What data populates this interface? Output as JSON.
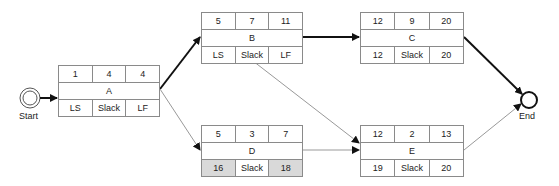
{
  "start": {
    "label": "Start"
  },
  "end": {
    "label": "End"
  },
  "nodes": {
    "A": {
      "es": "1",
      "dur": "4",
      "ef": "4",
      "name": "A",
      "ls": "LS",
      "slack": "Slack",
      "lf": "LF"
    },
    "B": {
      "es": "5",
      "dur": "7",
      "ef": "11",
      "name": "B",
      "ls": "LS",
      "slack": "Slack",
      "lf": "LF"
    },
    "C": {
      "es": "12",
      "dur": "9",
      "ef": "20",
      "name": "C",
      "ls": "12",
      "slack": "Slack",
      "lf": "20"
    },
    "D": {
      "es": "5",
      "dur": "3",
      "ef": "7",
      "name": "D",
      "ls": "16",
      "slack": "Slack",
      "lf": "18"
    },
    "E": {
      "es": "12",
      "dur": "2",
      "ef": "13",
      "name": "E",
      "ls": "19",
      "slack": "Slack",
      "lf": "20"
    }
  },
  "edges": [
    {
      "from": "Start",
      "to": "A",
      "critical": true
    },
    {
      "from": "A",
      "to": "B",
      "critical": true
    },
    {
      "from": "A",
      "to": "D",
      "critical": false
    },
    {
      "from": "B",
      "to": "C",
      "critical": true
    },
    {
      "from": "B",
      "to": "E",
      "critical": false
    },
    {
      "from": "D",
      "to": "E",
      "critical": false
    },
    {
      "from": "C",
      "to": "End",
      "critical": true
    },
    {
      "from": "E",
      "to": "End",
      "critical": false
    }
  ],
  "colors": {
    "critical": "#111111",
    "noncritical": "#8a8a8a",
    "shaded": "#d9d9d9"
  }
}
